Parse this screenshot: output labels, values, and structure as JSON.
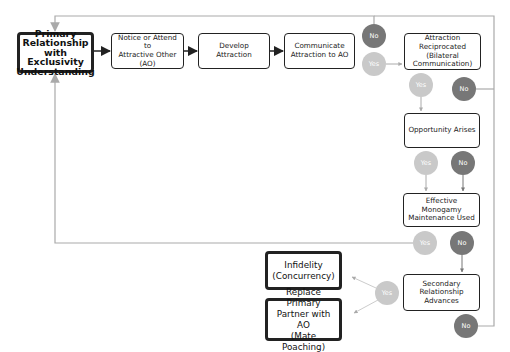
{
  "colors": {
    "box_border": "#222222",
    "no_circle": "#777777",
    "yes_circle": "#c9c9c9",
    "feedback_line": "#aaaaaa",
    "flow_arrow": "#222222"
  },
  "nodes": {
    "primary": "Primary\nRelationship with\nExclusivity\nUnderstanding",
    "notice": "Notice or Attend to\nAttractive Other\n(AO)",
    "develop": "Develop\nAttraction",
    "communicate": "Communicate\nAttraction to AO",
    "reciprocated": "Attraction\nReciprocated\n(Bilateral\nCommunication)",
    "opportunity": "Opportunity Arises",
    "maintenance": "Effective Monogamy\nMaintenance Used",
    "secondary": "Secondary\nRelationship\nAdvances",
    "infidelity": "Infidelity\n(Concurrency)",
    "replace": "Replace Primary\nPartner with AO\n(Mate Poaching)"
  },
  "decisions": {
    "communicate_no": "No",
    "communicate_yes": "Yes",
    "reciprocated_yes": "Yes",
    "reciprocated_no": "No",
    "opportunity_yes": "Yes",
    "opportunity_no": "No",
    "maintenance_yes": "Yes",
    "maintenance_no": "No",
    "secondary_yes": "Yes",
    "secondary_no": "No"
  }
}
